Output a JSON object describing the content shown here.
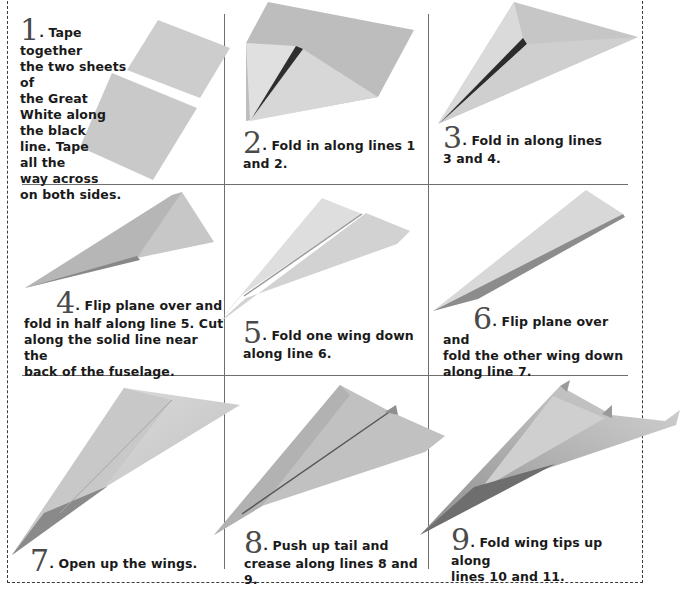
{
  "colors": {
    "paper_light": "#d9d9d9",
    "paper_mid": "#c4c4c4",
    "paper_dark": "#9a9a9a",
    "crease": "#3c3c3c",
    "text": "#1a1a1a",
    "divider": "#6e6e6e"
  },
  "steps": [
    {
      "number": "1",
      "text": ". Tape together\nthe two sheets of\nthe Great\nWhite along\nthe black\nline. Tape\nall the\nway across\non both sides."
    },
    {
      "number": "2",
      "text": ". Fold in along lines 1\nand 2."
    },
    {
      "number": "3",
      "text": ". Fold in along lines\n3 and 4."
    },
    {
      "number": "4",
      "text": ". Flip plane over and\nfold in half along line 5.  Cut\nalong the solid line near the\nback of the fuselage."
    },
    {
      "number": "5",
      "text": ". Fold one wing down\nalong line 6."
    },
    {
      "number": "6",
      "text": ". Flip plane over and\nfold the other wing down\nalong line 7."
    },
    {
      "number": "7",
      "text": ". Open up the wings."
    },
    {
      "number": "8",
      "text": ". Push up tail and\ncrease along lines 8 and 9."
    },
    {
      "number": "9",
      "text": ". Fold wing tips up along\nlines 10 and 11."
    }
  ]
}
